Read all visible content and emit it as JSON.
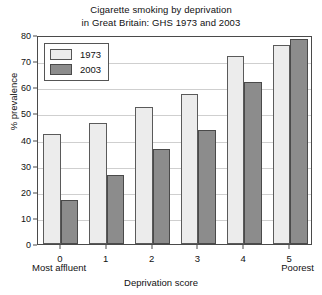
{
  "chart_data": {
    "type": "bar",
    "title": "Cigarette smoking by deprivation in Great Britain: GHS 1973 and 2003",
    "title_lines": [
      "Cigarette smoking by deprivation",
      "in Great Britain: GHS 1973 and 2003"
    ],
    "xlabel": "Deprivation score",
    "ylabel": "% prevalence",
    "categories": [
      "0",
      "1",
      "2",
      "3",
      "4",
      "5"
    ],
    "category_end_labels": {
      "left": "Most affluent",
      "right": "Poorest"
    },
    "ylim": [
      0,
      80
    ],
    "ytick_step": 10,
    "yticks": [
      0,
      10,
      20,
      30,
      40,
      50,
      60,
      70,
      80
    ],
    "grid": true,
    "legend_position": "top-left",
    "series": [
      {
        "name": "1973",
        "color": "#ececec",
        "values": [
          42,
          46.5,
          52.5,
          57.5,
          72,
          76
        ]
      },
      {
        "name": "2003",
        "color": "#8c8c8c",
        "values": [
          17,
          26.5,
          36.5,
          43.5,
          62,
          78.5
        ]
      }
    ]
  }
}
